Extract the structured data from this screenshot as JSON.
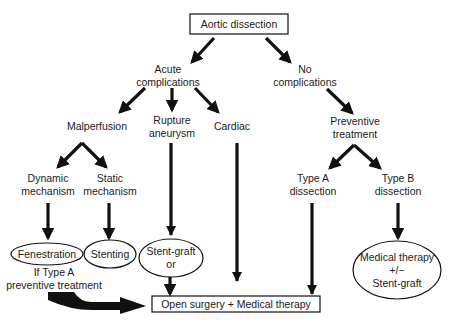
{
  "diagram": {
    "title": "Aortic dissection",
    "nodes": {
      "root": "Aortic dissection",
      "acute": [
        "Acute",
        "complications"
      ],
      "no_comp": [
        "No",
        "complications"
      ],
      "malperfusion": "Malperfusion",
      "rupture": [
        "Rupture",
        "aneurysm"
      ],
      "cardiac": "Cardiac",
      "preventive": [
        "Preventive",
        "treatment"
      ],
      "dynamic": [
        "Dynamic",
        "mechanism"
      ],
      "static": [
        "Static",
        "mechanism"
      ],
      "type_a": [
        "Type A",
        "dissection"
      ],
      "type_b": [
        "Type B",
        "dissection"
      ],
      "fenestration": "Fenestration",
      "stenting": "Stenting",
      "stent_graft": [
        "Stent-graft",
        "or"
      ],
      "medical": [
        "Medical therapy",
        "+/−",
        "Stent-graft"
      ],
      "if_type_a": [
        "If Type A",
        "preventive treatment"
      ],
      "open_surgery": "Open surgery + Medical therapy"
    },
    "colors": {
      "stroke": "#111111",
      "text": "#1a1a1a",
      "background": "#ffffff"
    }
  }
}
